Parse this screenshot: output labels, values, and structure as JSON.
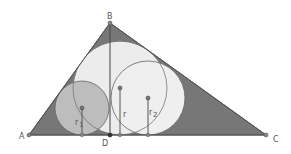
{
  "diagram": {
    "colors": {
      "triangle_fill": "#777777",
      "incircle_fill": "#ececec",
      "circle_r1_fill": "#bdbdbd",
      "circle_r2_fill": "#f4f4f4",
      "stroke": "#555555",
      "point": "#666666",
      "point_d": "#333333"
    },
    "points": {
      "A": {
        "label": "A",
        "x": 29,
        "y": 135
      },
      "B": {
        "label": "B",
        "x": 110,
        "y": 23
      },
      "C": {
        "label": "C",
        "x": 266,
        "y": 135
      },
      "D": {
        "label": "D",
        "x": 110,
        "y": 135
      }
    },
    "circles": [
      {
        "name": "incircle-abc",
        "cx": 120,
        "cy": 88,
        "r": 47,
        "radius_label": "r"
      },
      {
        "name": "incircle-abd",
        "cx": 82,
        "cy": 108,
        "r": 27,
        "radius_label": "r1"
      },
      {
        "name": "incircle-dbc",
        "cx": 148,
        "cy": 98,
        "r": 37,
        "radius_label": "r2"
      }
    ],
    "labels": {
      "A": "A",
      "B": "B",
      "C": "C",
      "D": "D",
      "r": "r",
      "r1": "r",
      "r1_sub": "1",
      "r2": "r",
      "r2_sub": "2"
    }
  }
}
